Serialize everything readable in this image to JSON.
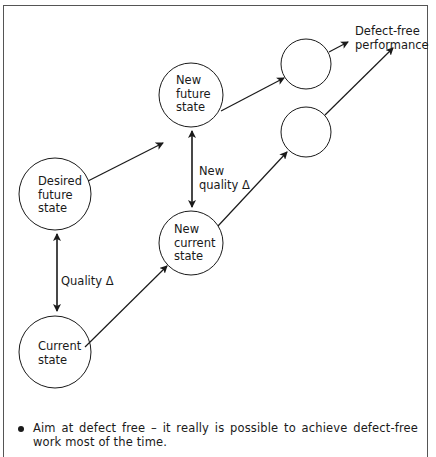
{
  "diagram": {
    "nodes": [
      {
        "id": "current",
        "label_lines": [
          "Current",
          "state"
        ]
      },
      {
        "id": "desired_future",
        "label_lines": [
          "Desired",
          "future",
          "state"
        ]
      },
      {
        "id": "new_current",
        "label_lines": [
          "New",
          "current",
          "state"
        ]
      },
      {
        "id": "new_future",
        "label_lines": [
          "New",
          "future",
          "state"
        ]
      },
      {
        "id": "next_current",
        "label_lines": []
      },
      {
        "id": "next_future",
        "label_lines": []
      }
    ],
    "edges": [
      {
        "from": "current",
        "to": "desired_future",
        "label": "Quality Δ",
        "bidirectional": true
      },
      {
        "from": "new_current",
        "to": "new_future",
        "label_lines": [
          "New",
          "quality Δ"
        ],
        "bidirectional": true
      },
      {
        "from": "current",
        "to": "new_current"
      },
      {
        "from": "desired_future",
        "to": "new_future"
      },
      {
        "from": "new_current",
        "to": "next_current"
      },
      {
        "from": "new_future",
        "to": "next_future"
      },
      {
        "from": "next_future",
        "to": "defect_free"
      },
      {
        "from": "next_current",
        "to": "defect_free"
      }
    ],
    "target_label_lines": [
      "Defect-free",
      "performance"
    ]
  },
  "bullet": {
    "text": "Aim at defect free – it really is possible to achieve defect-free work most of the time."
  },
  "colors": {
    "line": "#1a1a1a",
    "frame": "#555555",
    "background": "#ffffff"
  }
}
